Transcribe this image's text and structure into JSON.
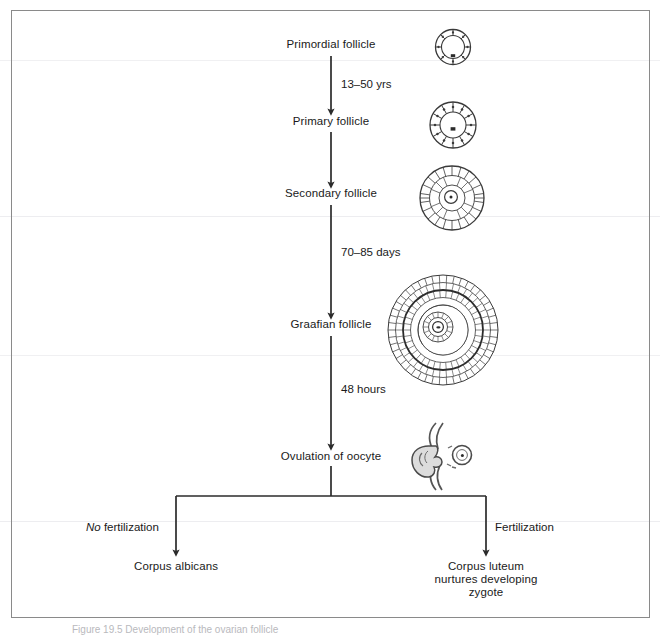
{
  "figure": {
    "caption": "Figure 19.5  Development of the ovarian follicle",
    "frame_color": "#8a8a8a",
    "line_color": "#2b2b2b",
    "text_color": "#1a1a1a"
  },
  "nodes": [
    {
      "id": "primordial",
      "label": "Primordial follicle"
    },
    {
      "id": "primary",
      "label": "Primary follicle"
    },
    {
      "id": "secondary",
      "label": "Secondary follicle"
    },
    {
      "id": "graafian",
      "label": "Graafian follicle"
    },
    {
      "id": "ovulation",
      "label": "Ovulation of oocyte"
    },
    {
      "id": "corpus_albicans",
      "label": "Corpus albicans"
    },
    {
      "id": "corpus_luteum_line1",
      "label": "Corpus luteum"
    },
    {
      "id": "corpus_luteum_line2",
      "label": "nurtures developing"
    },
    {
      "id": "corpus_luteum_line3",
      "label": "zygote"
    }
  ],
  "edge_labels": [
    {
      "id": "edge_primordial_primary",
      "label": "13–50 yrs"
    },
    {
      "id": "edge_secondary_graafian",
      "label": "70–85 days"
    },
    {
      "id": "edge_graafian_ovulation",
      "label": "48 hours"
    },
    {
      "id": "edge_no_fertilization_em",
      "label": "No"
    },
    {
      "id": "edge_no_fertilization_rest",
      "label": " fertilization"
    },
    {
      "id": "edge_fertilization",
      "label": "Fertilization"
    }
  ],
  "illustrations": [
    {
      "id": "primordial-follicle-art",
      "name": "primordial follicle cross-section"
    },
    {
      "id": "primary-follicle-art",
      "name": "primary follicle cross-section"
    },
    {
      "id": "secondary-follicle-art",
      "name": "secondary follicle cross-section"
    },
    {
      "id": "graafian-follicle-art",
      "name": "graafian follicle cross-section"
    },
    {
      "id": "ovulation-art",
      "name": "ovary releasing oocyte"
    }
  ]
}
